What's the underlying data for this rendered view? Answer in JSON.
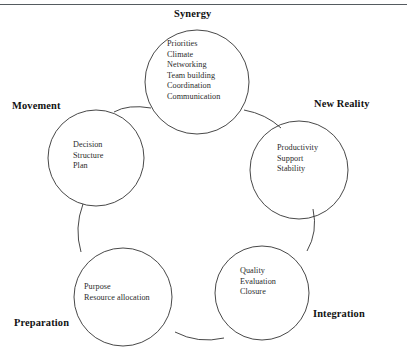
{
  "diagram": {
    "top_rule_color": "#555b60",
    "stroke_color": "#333333",
    "text_color": "#2b2b2b",
    "label_color": "#121212",
    "background": "#ffffff",
    "nodes": [
      {
        "id": "synergy",
        "label": "Synergy",
        "label_position": "top",
        "items": [
          "Priorities",
          "Climate",
          "Networking",
          "Team building",
          "Coordination",
          "Communication"
        ]
      },
      {
        "id": "new-reality",
        "label": "New Reality",
        "label_position": "top-right",
        "items": [
          "Productivity",
          "Support",
          "Stability"
        ]
      },
      {
        "id": "integration",
        "label": "Integration",
        "label_position": "bottom-right",
        "items": [
          "Quality",
          "Evaluation",
          "Closure"
        ]
      },
      {
        "id": "preparation",
        "label": "Preparation",
        "label_position": "bottom-left",
        "items": [
          "Purpose",
          "Resource allocation"
        ]
      },
      {
        "id": "movement",
        "label": "Movement",
        "label_position": "top-left",
        "items": [
          "Decision",
          "Structure",
          "Plan"
        ]
      }
    ]
  }
}
